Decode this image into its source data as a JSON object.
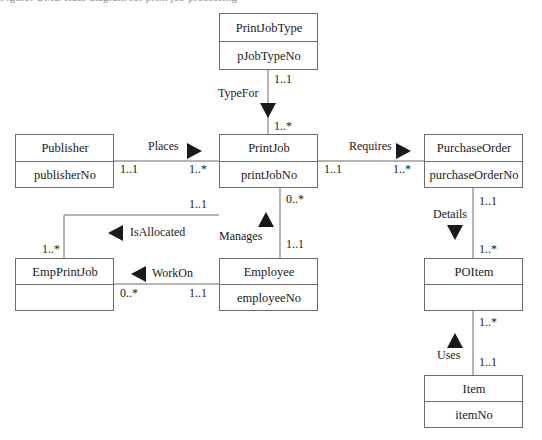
{
  "page": {
    "clipped_header_text": "Figure: UML class diagram for print job processing",
    "background_color": "#ffffff",
    "border_color": "#6b6b6b",
    "text_color": "#1a1a1a"
  },
  "classes": [
    {
      "id": "printjobtype",
      "name": "PrintJobType",
      "attribute": "pJobTypeNo",
      "x": 219,
      "y": 13,
      "w": 99,
      "h": 57,
      "name_h": 28
    },
    {
      "id": "publisher",
      "name": "Publisher",
      "attribute": "publisherNo",
      "x": 15,
      "y": 134,
      "w": 99,
      "h": 54,
      "name_h": 27
    },
    {
      "id": "printjob",
      "name": "PrintJob",
      "attribute": "printJobNo",
      "x": 219,
      "y": 134,
      "w": 99,
      "h": 54,
      "name_h": 27
    },
    {
      "id": "purchaseorder",
      "name": "PurchaseOrder",
      "attribute": "purchaseOrderNo",
      "x": 424,
      "y": 134,
      "w": 99,
      "h": 54,
      "name_h": 27
    },
    {
      "id": "empprintjob",
      "name": "EmpPrintJob",
      "attribute": "",
      "x": 15,
      "y": 258,
      "w": 99,
      "h": 53,
      "name_h": 26
    },
    {
      "id": "employee",
      "name": "Employee",
      "attribute": "employeeNo",
      "x": 219,
      "y": 258,
      "w": 99,
      "h": 53,
      "name_h": 26
    },
    {
      "id": "poitem",
      "name": "POItem",
      "attribute": "",
      "x": 424,
      "y": 258,
      "w": 99,
      "h": 53,
      "name_h": 26
    },
    {
      "id": "item",
      "name": "Item",
      "attribute": "itemNo",
      "x": 424,
      "y": 375,
      "w": 99,
      "h": 53,
      "name_h": 26
    }
  ],
  "associations": [
    {
      "id": "typefor",
      "label": "TypeFor",
      "from": "printjobtype",
      "to": "printjob",
      "arrow_direction": "down",
      "label_x": 218,
      "label_y": 97,
      "arrow_x": 260,
      "arrow_y": 103,
      "source_multiplicity": "1..1",
      "source_mult_x": 274,
      "source_mult_y": 83,
      "target_multiplicity": "1..*",
      "target_mult_x": 274,
      "target_mult_y": 129
    },
    {
      "id": "places",
      "label": "Places",
      "from": "publisher",
      "to": "printjob",
      "arrow_direction": "right",
      "label_x": 148,
      "label_y": 150,
      "arrow_x": 187,
      "arrow_y": 143,
      "source_multiplicity": "1..1",
      "source_mult_x": 120,
      "source_mult_y": 173,
      "target_multiplicity": "1..*",
      "target_mult_x": 189,
      "target_mult_y": 173
    },
    {
      "id": "requires",
      "label": "Requires",
      "from": "printjob",
      "to": "purchaseorder",
      "arrow_direction": "right",
      "label_x": 349,
      "label_y": 150,
      "arrow_x": 396,
      "arrow_y": 143,
      "source_multiplicity": "1..1",
      "source_mult_x": 324,
      "source_mult_y": 173,
      "target_multiplicity": "1..*",
      "target_mult_x": 394,
      "target_mult_y": 173
    },
    {
      "id": "isallocated",
      "label": "IsAllocated",
      "from": "printjob",
      "to": "empprintjob",
      "arrow_direction": "left",
      "label_x": 130,
      "label_y": 236,
      "arrow_x": 108,
      "arrow_y": 225,
      "source_multiplicity": "1..1",
      "source_mult_x": 190,
      "source_mult_y": 203,
      "target_multiplicity": "1..*",
      "target_mult_x": 42,
      "target_mult_y": 252
    },
    {
      "id": "manages",
      "label": "Manages",
      "from": "printjob",
      "to": "employee",
      "arrow_direction": "up",
      "label_x": 220,
      "label_y": 239,
      "arrow_x": 258,
      "arrow_y": 212,
      "source_multiplicity": "0..*",
      "source_mult_x": 286,
      "source_mult_y": 203,
      "target_multiplicity": "1..1",
      "target_mult_x": 286,
      "target_mult_y": 249
    },
    {
      "id": "workon",
      "label": "WorkOn",
      "from": "empprintjob",
      "to": "employee",
      "arrow_direction": "left",
      "label_x": 152,
      "label_y": 277,
      "arrow_x": 131,
      "arrow_y": 266,
      "source_multiplicity": "0..*",
      "source_mult_x": 120,
      "source_mult_y": 297,
      "target_multiplicity": "1..1",
      "target_mult_x": 190,
      "target_mult_y": 297
    },
    {
      "id": "details",
      "label": "Details",
      "from": "purchaseorder",
      "to": "poitem",
      "arrow_direction": "down",
      "label_x": 433,
      "label_y": 218,
      "arrow_x": 455,
      "arrow_y": 225,
      "source_multiplicity": "1..1",
      "source_mult_x": 479,
      "source_mult_y": 205,
      "target_multiplicity": "1..*",
      "target_mult_x": 479,
      "target_mult_y": 252
    },
    {
      "id": "uses",
      "label": "Uses",
      "from": "item",
      "to": "poitem",
      "arrow_direction": "up",
      "label_x": 438,
      "label_y": 359,
      "arrow_x": 455,
      "arrow_y": 333,
      "source_multiplicity": "1..*",
      "source_mult_x": 479,
      "source_mult_y": 326,
      "target_multiplicity": "1..1",
      "target_mult_x": 479,
      "target_mult_y": 366
    }
  ]
}
